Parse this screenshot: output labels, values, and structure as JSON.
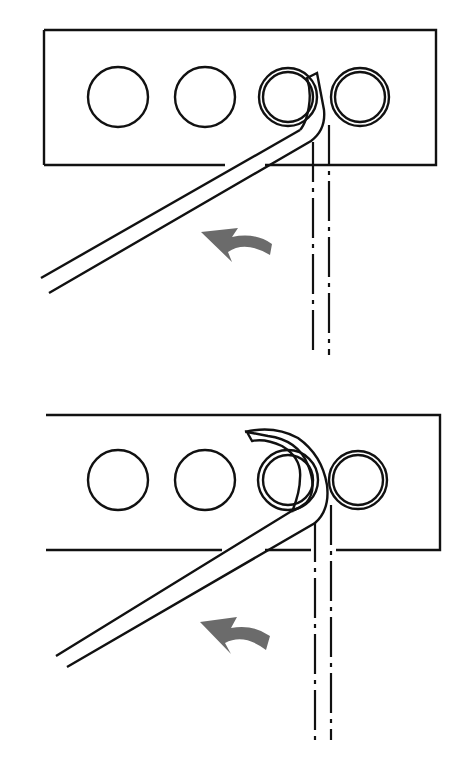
{
  "figure": {
    "colors": {
      "line": "#111111",
      "arrow": "#6b6b6b",
      "background": "#ffffff"
    },
    "panels": [
      {
        "id": "step-1",
        "label": "Partial bend",
        "arrow": "curved-arrow-counterclockwise"
      },
      {
        "id": "step-2",
        "label": "Full hook bend",
        "arrow": "curved-arrow-counterclockwise"
      }
    ]
  }
}
